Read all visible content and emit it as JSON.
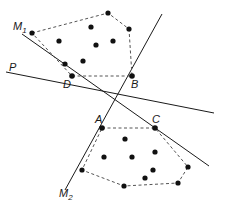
{
  "figure": {
    "width": 231,
    "height": 214,
    "background": "#ffffff",
    "stroke_color": "#1a1a1a",
    "dot_color": "#111111",
    "dash_color": "#555555"
  },
  "labels": {
    "m1": {
      "text": "M",
      "sub": "1",
      "x": 13,
      "y": 21
    },
    "m2": {
      "text": "M",
      "sub": "2",
      "x": 59,
      "y": 188
    },
    "p": {
      "text": "P",
      "sub": "",
      "x": 9,
      "y": 62
    },
    "a": {
      "text": "A",
      "sub": "",
      "x": 95,
      "y": 114
    },
    "b": {
      "text": "B",
      "sub": "",
      "x": 131,
      "y": 79
    },
    "c": {
      "text": "C",
      "sub": "",
      "x": 152,
      "y": 114
    },
    "d": {
      "text": "D",
      "sub": "",
      "x": 63,
      "y": 79
    }
  },
  "lines": [
    {
      "name": "line-p",
      "x1": 6,
      "y1": 72,
      "x2": 214,
      "y2": 113
    },
    {
      "name": "line-m1",
      "x1": 22,
      "y1": 34,
      "x2": 209,
      "y2": 166
    },
    {
      "name": "line-m2",
      "x1": 162,
      "y1": 14,
      "x2": 65,
      "y2": 190
    }
  ],
  "hulls": [
    {
      "name": "upper-hull",
      "vertices": [
        [
          32,
          33
        ],
        [
          108,
          13
        ],
        [
          129,
          29
        ],
        [
          132,
          76
        ],
        [
          72,
          76
        ]
      ]
    },
    {
      "name": "lower-hull",
      "vertices": [
        [
          102,
          128
        ],
        [
          155,
          128
        ],
        [
          188,
          167
        ],
        [
          178,
          183
        ],
        [
          124,
          186
        ],
        [
          82,
          170
        ]
      ]
    }
  ],
  "points": {
    "upper_cloud": [
      [
        32,
        33
      ],
      [
        108,
        13
      ],
      [
        129,
        29
      ],
      [
        132,
        76
      ],
      [
        72,
        76
      ],
      [
        59,
        41
      ],
      [
        91,
        27
      ],
      [
        96,
        45
      ],
      [
        113,
        41
      ],
      [
        83,
        61
      ],
      [
        65,
        64
      ]
    ],
    "lower_cloud": [
      [
        102,
        128
      ],
      [
        155,
        128
      ],
      [
        188,
        167
      ],
      [
        178,
        183
      ],
      [
        124,
        186
      ],
      [
        82,
        170
      ],
      [
        125,
        139
      ],
      [
        104,
        157
      ],
      [
        132,
        157
      ],
      [
        155,
        152
      ],
      [
        153,
        170
      ],
      [
        145,
        178
      ]
    ]
  },
  "vertex_points": {
    "A": [
      102,
      128
    ],
    "B": [
      132,
      76
    ],
    "C": [
      155,
      128
    ],
    "D": [
      72,
      76
    ]
  }
}
